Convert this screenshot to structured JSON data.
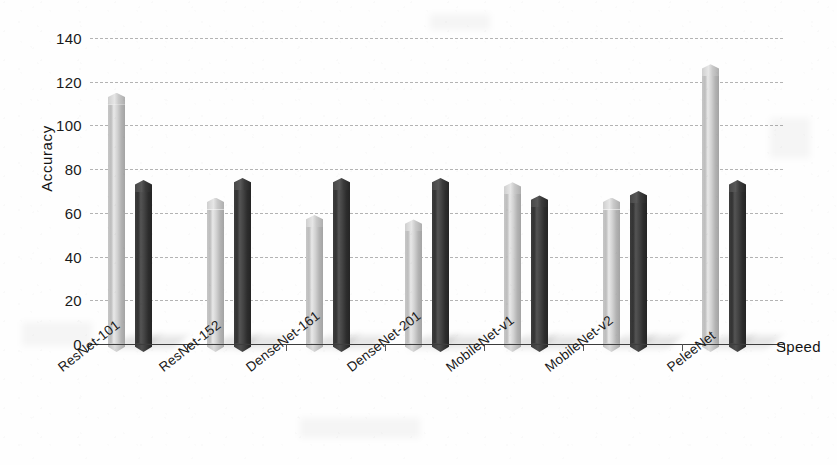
{
  "chart_data": {
    "type": "bar",
    "title": "",
    "xlabel": "Speed",
    "ylabel": "Accuracy",
    "categories": [
      "ResNet-101",
      "ResNet-152",
      "DenseNet-161",
      "DenseNet-201",
      "MobileNet-v1",
      "MobileNet-v2",
      "PeleeNet"
    ],
    "series": [
      {
        "name": "Speed",
        "color": "#bdbdbd",
        "values": [
          115,
          67,
          59,
          57,
          74,
          67,
          128
        ]
      },
      {
        "name": "Accuracy",
        "color": "#343434",
        "values": [
          75,
          76,
          76,
          76,
          68,
          70,
          75
        ]
      }
    ],
    "ylim": [
      0,
      140
    ],
    "ytick_labels": [
      "140",
      "120",
      "100",
      "80",
      "60",
      "40",
      "20",
      "0"
    ],
    "ytick_values": [
      140,
      120,
      100,
      80,
      60,
      40,
      20,
      0
    ],
    "grid": true,
    "grid_style": "dashed-horizontal",
    "legend": "none",
    "bar_style": "3d-prism-pointed-cap"
  }
}
